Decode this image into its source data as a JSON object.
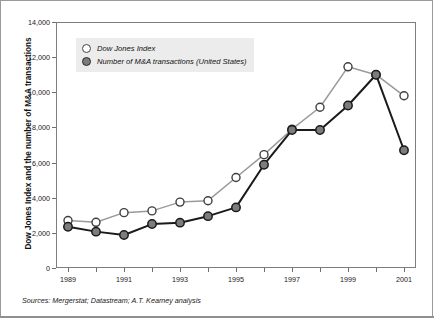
{
  "figure": {
    "source_note": "Sources: Mergerstat; Datastream; A.T. Kearney analysis"
  },
  "chart_data": {
    "type": "line",
    "title": "",
    "subtitle": "",
    "xlabel": "",
    "ylabel": "Dow Jones Index and the number of M&A transactions",
    "x": [
      1989,
      1990,
      1991,
      1992,
      1993,
      1994,
      1995,
      1996,
      1997,
      1998,
      1999,
      2000,
      2001
    ],
    "categories": [
      "1989",
      "1990",
      "1991",
      "1992",
      "1993",
      "1994",
      "1995",
      "1996",
      "1997",
      "1998",
      "1999",
      "2000",
      "2001"
    ],
    "xtick_labels": [
      "1989",
      "",
      "1991",
      "",
      "1993",
      "",
      "1995",
      "",
      "1997",
      "",
      "1999",
      "",
      "2001"
    ],
    "ytick_labels": [
      "0",
      "2,000",
      "4,000",
      "6,000",
      "8,000",
      "10,000",
      "12,000",
      "14,000"
    ],
    "ytick_values": [
      0,
      2000,
      4000,
      6000,
      8000,
      10000,
      12000,
      14000
    ],
    "ylim": [
      0,
      14000
    ],
    "xlim": [
      1989,
      2001
    ],
    "grid": false,
    "legend_position": "top-left",
    "series": [
      {
        "name": "Dow Jones Index",
        "marker": "open-circle",
        "line_color": "#9a9a9a",
        "marker_fill": "#ffffff",
        "marker_edge": "#3f3f3f",
        "values": [
          2700,
          2600,
          3150,
          3250,
          3750,
          3830,
          5150,
          6450,
          7900,
          9150,
          11450,
          11000,
          9800
        ]
      },
      {
        "name": "Number of M&A transactions (United States)",
        "marker": "filled-circle",
        "line_color": "#1a1a1a",
        "marker_fill": "#7c7c7c",
        "marker_edge": "#1a1a1a",
        "values": [
          2350,
          2070,
          1880,
          2500,
          2580,
          2950,
          3450,
          5880,
          7850,
          7850,
          9250,
          11000,
          6700
        ]
      }
    ],
    "colors": {
      "dow_line": "#9a9a9a",
      "ma_line": "#1a1a1a",
      "ma_marker_fill": "#7c7c7c",
      "legend_background": "#ececec",
      "axis": "#7d7d7d",
      "frame": "#9a9a9a"
    }
  }
}
